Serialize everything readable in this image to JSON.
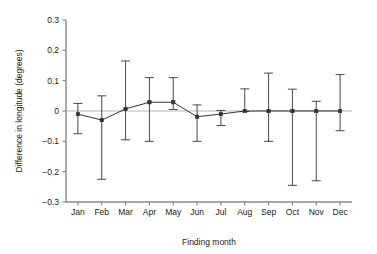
{
  "chart_data": {
    "type": "line",
    "title": "",
    "xlabel": "Finding month",
    "ylabel": "Difference in longitude (degrees)",
    "categories": [
      "Jan",
      "Feb",
      "Mar",
      "Apr",
      "May",
      "Jun",
      "Jul",
      "Aug",
      "Sep",
      "Oct",
      "Nov",
      "Dec"
    ],
    "values": [
      -0.01,
      -0.03,
      0.007,
      0.029,
      0.029,
      -0.019,
      -0.01,
      0.0,
      0.0,
      0.0,
      0.0,
      0.0
    ],
    "error_upper": [
      0.025,
      0.05,
      0.165,
      0.11,
      0.11,
      0.02,
      0.002,
      0.073,
      0.125,
      0.072,
      0.032,
      0.12
    ],
    "error_lower": [
      -0.075,
      -0.225,
      -0.095,
      -0.1,
      0.005,
      -0.1,
      -0.048,
      -0.002,
      -0.1,
      -0.245,
      -0.23,
      -0.065
    ],
    "ylim": [
      -0.3,
      0.3
    ],
    "yticks": [
      0.3,
      0.2,
      0.1,
      0.0,
      -0.1,
      -0.2,
      -0.3
    ],
    "ytick_labels": [
      "0.3",
      "0.2",
      "0.1",
      "0",
      "−0.1",
      "−0.2",
      "−0.3"
    ],
    "grid": false,
    "legend": "none",
    "zero_line": true,
    "marker": "square",
    "series_color": "#333333",
    "zero_line_color": "#b8b8b8",
    "axis_color": "#888888"
  }
}
